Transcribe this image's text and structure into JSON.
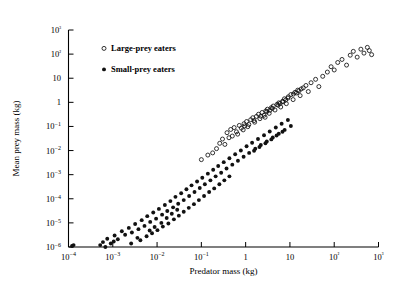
{
  "chart_data": {
    "type": "scatter",
    "title": "",
    "xlabel": "Predator mass (kg)",
    "ylabel": "Mean prey mass (kg)",
    "xscale": "log",
    "yscale": "log",
    "xlim": [
      0.0001,
      1000
    ],
    "ylim": [
      1e-06,
      1000
    ],
    "grid": false,
    "xticks": [
      0.0001,
      0.001,
      0.01,
      0.1,
      1,
      10,
      100,
      1000
    ],
    "xticklabels": [
      "10−4",
      "10−3",
      "10−2",
      "10−1",
      "1",
      "10",
      "10²",
      "10³"
    ],
    "yticks": [
      1e-06,
      1e-05,
      0.0001,
      0.001,
      0.01,
      0.1,
      1,
      10,
      100,
      1000
    ],
    "yticklabels": [
      "10−6",
      "10−5",
      "10−4",
      "10−3",
      "10−2",
      "10−1",
      "1",
      "10",
      "10²",
      "10³"
    ],
    "legend_position": "upper-left-inside",
    "series": [
      {
        "name": "Large-prey eaters",
        "marker": "open-circle",
        "color": "#111111",
        "points": [
          [
            0.3,
            0.03
          ],
          [
            0.38,
            0.055
          ],
          [
            0.26,
            0.02
          ],
          [
            0.46,
            0.075
          ],
          [
            0.55,
            0.09
          ],
          [
            0.62,
            0.06
          ],
          [
            0.72,
            0.11
          ],
          [
            0.8,
            0.085
          ],
          [
            0.92,
            0.13
          ],
          [
            1.05,
            0.16
          ],
          [
            1.18,
            0.12
          ],
          [
            1.3,
            0.19
          ],
          [
            1.45,
            0.23
          ],
          [
            1.6,
            0.15
          ],
          [
            1.75,
            0.26
          ],
          [
            1.95,
            0.32
          ],
          [
            2.1,
            0.21
          ],
          [
            2.35,
            0.38
          ],
          [
            2.6,
            0.29
          ],
          [
            2.85,
            0.44
          ],
          [
            3.1,
            0.52
          ],
          [
            3.4,
            0.35
          ],
          [
            3.8,
            0.6
          ],
          [
            4.2,
            0.7
          ],
          [
            4.6,
            0.48
          ],
          [
            5.1,
            0.82
          ],
          [
            5.6,
            0.95
          ],
          [
            6.2,
            0.64
          ],
          [
            6.8,
            1.1
          ],
          [
            7.5,
            1.4
          ],
          [
            8.3,
            0.88
          ],
          [
            9.2,
            1.7
          ],
          [
            10.5,
            2.1
          ],
          [
            11.8,
            1.3
          ],
          [
            13.0,
            2.6
          ],
          [
            15.0,
            3.2
          ],
          [
            17.0,
            1.9
          ],
          [
            20.0,
            4.0
          ],
          [
            23.0,
            5.0
          ],
          [
            26.0,
            2.8
          ],
          [
            0.22,
            0.012
          ],
          [
            0.18,
            0.008
          ],
          [
            0.34,
            0.018
          ],
          [
            0.42,
            0.034
          ],
          [
            0.66,
            0.048
          ],
          [
            0.88,
            0.072
          ],
          [
            1.12,
            0.098
          ],
          [
            1.55,
            0.175
          ],
          [
            2.2,
            0.265
          ],
          [
            3.0,
            0.41
          ],
          [
            4.0,
            0.56
          ],
          [
            5.4,
            0.76
          ],
          [
            7.0,
            1.05
          ],
          [
            9.0,
            1.5
          ],
          [
            12.0,
            2.2
          ],
          [
            16.0,
            3.0
          ],
          [
            30.0,
            6.5
          ],
          [
            38.0,
            9.0
          ],
          [
            45.0,
            4.5
          ],
          [
            55.0,
            12.0
          ],
          [
            70.0,
            18.0
          ],
          [
            85.0,
            30.0
          ],
          [
            100.0,
            22.0
          ],
          [
            120.0,
            45.0
          ],
          [
            150.0,
            60.0
          ],
          [
            190.0,
            35.0
          ],
          [
            230.0,
            90.0
          ],
          [
            270.0,
            130.0
          ],
          [
            330.0,
            75.0
          ],
          [
            400.0,
            160.0
          ],
          [
            470.0,
            110.0
          ],
          [
            560.0,
            190.0
          ],
          [
            620.0,
            140.0
          ],
          [
            700.0,
            95.0
          ],
          [
            0.14,
            0.0065
          ],
          [
            0.1,
            0.0042
          ],
          [
            2.75,
            0.24
          ],
          [
            3.55,
            0.47
          ],
          [
            6.0,
            0.9
          ],
          [
            8.0,
            1.25
          ],
          [
            14.0,
            2.45
          ],
          [
            18.0,
            3.6
          ],
          [
            0.5,
            0.04
          ],
          [
            0.95,
            0.105
          ]
        ]
      },
      {
        "name": "Small-prey eaters",
        "marker": "filled-circle",
        "color": "#111111",
        "points": [
          [
            0.00012,
            1.1e-06
          ],
          [
            0.00013,
            1.2e-06
          ],
          [
            0.00052,
            1.2e-06
          ],
          [
            0.0006,
            1.6e-06
          ],
          [
            0.00075,
            2.2e-06
          ],
          [
            0.0009,
            1.4e-06
          ],
          [
            0.0011,
            3e-06
          ],
          [
            0.0013,
            2.1e-06
          ],
          [
            0.0016,
            4.5e-06
          ],
          [
            0.0019,
            3.2e-06
          ],
          [
            0.0023,
            6.2e-06
          ],
          [
            0.0027,
            4e-06
          ],
          [
            0.0032,
            9e-06
          ],
          [
            0.0038,
            5.5e-06
          ],
          [
            0.0045,
            1.3e-05
          ],
          [
            0.0052,
            7.5e-06
          ],
          [
            0.006,
            1.9e-05
          ],
          [
            0.007,
            1.1e-05
          ],
          [
            0.0082,
            2.7e-05
          ],
          [
            0.0095,
            1.5e-05
          ],
          [
            0.011,
            3.8e-05
          ],
          [
            0.013,
            2.2e-05
          ],
          [
            0.015,
            5.5e-05
          ],
          [
            0.017,
            3.1e-05
          ],
          [
            0.02,
            8e-05
          ],
          [
            0.023,
            4.4e-05
          ],
          [
            0.026,
            0.00012
          ],
          [
            0.03,
            6.2e-05
          ],
          [
            0.035,
            0.00017
          ],
          [
            0.04,
            8.8e-05
          ],
          [
            0.046,
            0.00025
          ],
          [
            0.053,
            0.00013
          ],
          [
            0.06,
            0.00036
          ],
          [
            0.07,
            0.00019
          ],
          [
            0.08,
            0.00052
          ],
          [
            0.092,
            0.00028
          ],
          [
            0.105,
            0.00075
          ],
          [
            0.12,
            0.0004
          ],
          [
            0.14,
            0.0011
          ],
          [
            0.16,
            0.00058
          ],
          [
            0.185,
            0.0016
          ],
          [
            0.21,
            0.00085
          ],
          [
            0.24,
            0.0023
          ],
          [
            0.28,
            0.0012
          ],
          [
            0.32,
            0.0033
          ],
          [
            0.37,
            0.0018
          ],
          [
            0.43,
            0.0048
          ],
          [
            0.5,
            0.0026
          ],
          [
            0.58,
            0.007
          ],
          [
            0.67,
            0.0038
          ],
          [
            0.78,
            0.01
          ],
          [
            0.9,
            0.0055
          ],
          [
            1.05,
            0.015
          ],
          [
            1.2,
            0.008
          ],
          [
            1.4,
            0.021
          ],
          [
            1.65,
            0.012
          ],
          [
            1.9,
            0.03
          ],
          [
            2.2,
            0.017
          ],
          [
            2.6,
            0.043
          ],
          [
            3.0,
            0.024
          ],
          [
            3.5,
            0.062
          ],
          [
            4.1,
            0.035
          ],
          [
            4.8,
            0.09
          ],
          [
            5.6,
            0.05
          ],
          [
            6.5,
            0.13
          ],
          [
            7.6,
            0.072
          ],
          [
            9.0,
            0.185
          ],
          [
            10.5,
            0.105
          ],
          [
            0.0042,
            1.9e-06
          ],
          [
            0.0058,
            2.8e-06
          ],
          [
            0.0077,
            3.7e-06
          ],
          [
            0.0102,
            5e-06
          ],
          [
            0.0135,
            7e-06
          ],
          [
            0.018,
            9.5e-06
          ],
          [
            0.024,
            1.4e-05
          ],
          [
            0.031,
            2e-05
          ],
          [
            0.04,
            2.9e-05
          ],
          [
            0.052,
            4.2e-05
          ],
          [
            0.068,
            6e-05
          ],
          [
            0.088,
            8.8e-05
          ],
          [
            0.115,
            0.00013
          ],
          [
            0.15,
            0.00019
          ],
          [
            0.195,
            0.00027
          ],
          [
            0.255,
            0.0004
          ],
          [
            0.33,
            0.00058
          ],
          [
            0.43,
            0.00085
          ],
          [
            0.0026,
            1.4e-06
          ],
          [
            0.0036,
            2.4e-06
          ],
          [
            0.0068,
            4.8e-06
          ],
          [
            0.0088,
            6.8e-06
          ],
          [
            0.0125,
            1e-05
          ],
          [
            0.0165,
            1.6e-05
          ],
          [
            0.0215,
            2.4e-05
          ],
          [
            0.0285,
            3.5e-05
          ],
          [
            1.55,
            0.0098
          ],
          [
            2.05,
            0.014
          ],
          [
            2.8,
            0.02
          ],
          [
            3.8,
            0.029
          ],
          [
            5.0,
            0.042
          ],
          [
            6.8,
            0.06
          ],
          [
            0.00068,
            1e-06
          ],
          [
            0.00105,
            1.7e-06
          ]
        ]
      }
    ]
  },
  "legend": {
    "items": [
      {
        "label": "Large-prey eaters",
        "marker": "open-circle"
      },
      {
        "label": "Small-prey eaters",
        "marker": "filled-circle"
      }
    ]
  }
}
